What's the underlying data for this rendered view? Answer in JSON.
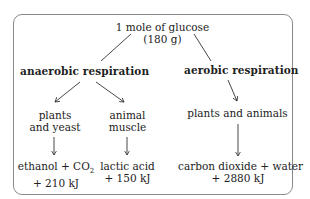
{
  "diagram": {
    "top_cut_text": "",
    "root": {
      "line1": "1 mole of glucose",
      "line2": "(180 g)"
    },
    "branches": [
      {
        "label": "anaerobic respiration",
        "children": [
          {
            "organism_line1": "plants",
            "organism_line2": "and yeast",
            "product_line1": "ethanol + CO",
            "product_sub": "2",
            "product_line2": "+ 210 kJ"
          },
          {
            "organism_line1": "animal",
            "organism_line2": "muscle",
            "product_line1": "lactic acid",
            "product_line2": "+ 150 kJ"
          }
        ]
      },
      {
        "label": "aerobic respiration",
        "children": [
          {
            "organism_line1": "plants and animals",
            "product_line1": "carbon dioxide + water",
            "product_line2": "+ 2880 kJ"
          }
        ]
      }
    ],
    "colors": {
      "border": "#8a8a8a",
      "text": "#222222",
      "lines": "#333333"
    }
  }
}
